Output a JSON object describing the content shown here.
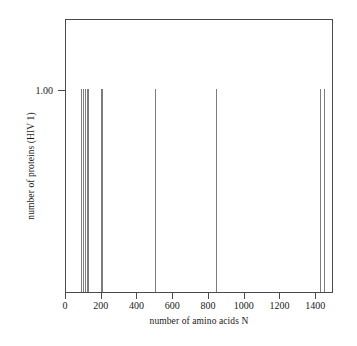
{
  "chart_data": {
    "type": "bar",
    "title": "",
    "subtitle": "",
    "xlabel": "number of amino acids N",
    "ylabel": "number of proteins (HIV 1)",
    "xlim": [
      0,
      1500
    ],
    "ylim": [
      0,
      1.35
    ],
    "grid": false,
    "legend": null,
    "xticks": [
      0,
      200,
      400,
      600,
      800,
      1000,
      1200,
      1400
    ],
    "xticklabels": [
      "0",
      "200",
      "400",
      "600",
      "800",
      "1000",
      "1200",
      "1400"
    ],
    "yticks": [
      1.0
    ],
    "yticklabels": [
      "1.00"
    ],
    "series": [
      {
        "name": "HIV 1 proteins",
        "color": "#7d7d7d",
        "x": [
          85,
          96,
          104,
          115,
          123,
          194,
          199,
          500,
          840,
          1420,
          1442
        ],
        "values": [
          1.0,
          1.0,
          1.0,
          1.0,
          1.0,
          1.0,
          1.0,
          1.0,
          1.0,
          1.0,
          1.0
        ]
      }
    ],
    "annotations": []
  },
  "axes": {
    "frame_color": "#4a4a4a",
    "tick_color": "#4a4a4a",
    "text_color": "#1a1a1a",
    "background": "#ffffff"
  }
}
